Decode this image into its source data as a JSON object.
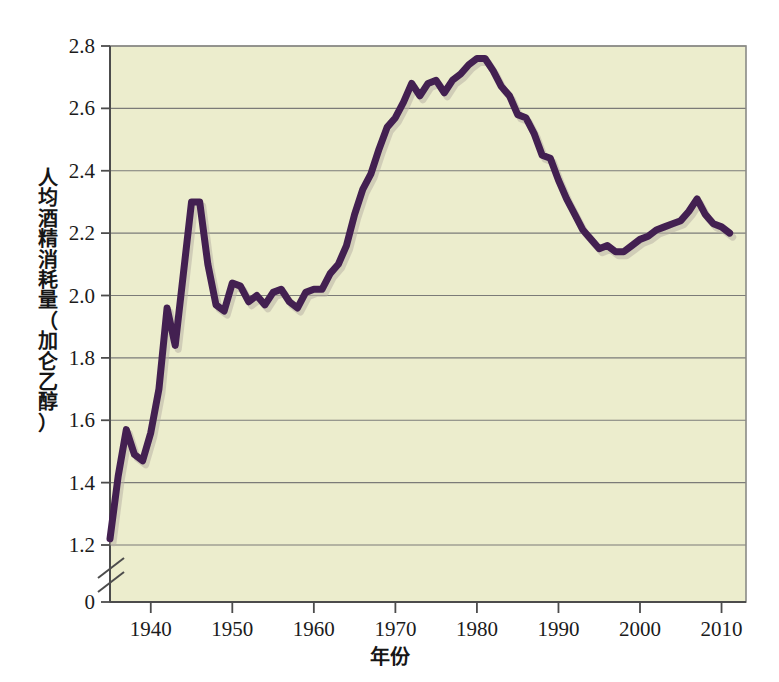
{
  "chart_data": {
    "type": "line",
    "title": "",
    "xlabel": "年份",
    "ylabel": "人均酒精消耗量（加仑乙醇）",
    "xlim": [
      1935,
      2013
    ],
    "ylim": [
      1.15,
      2.8
    ],
    "axis_break": true,
    "axis_break_note": "y-axis broken between 0 and 1.2",
    "grid": true,
    "legend": "none",
    "y_ticks": [
      "0",
      "1.2",
      "1.4",
      "1.6",
      "1.8",
      "2.0",
      "2.2",
      "2.4",
      "2.6",
      "2.8"
    ],
    "y_tick_values": [
      0,
      1.2,
      1.4,
      1.6,
      1.8,
      2.0,
      2.2,
      2.4,
      2.6,
      2.8
    ],
    "x_ticks": [
      "1940",
      "1950",
      "1960",
      "1970",
      "1980",
      "1990",
      "2000",
      "2010"
    ],
    "x_tick_values": [
      1940,
      1950,
      1960,
      1970,
      1980,
      1990,
      2000,
      2010
    ],
    "series": [
      {
        "name": "人均酒精消耗量",
        "color": "#432051",
        "x": [
          1935,
          1936,
          1937,
          1938,
          1939,
          1940,
          1941,
          1942,
          1943,
          1944,
          1945,
          1946,
          1947,
          1948,
          1949,
          1950,
          1951,
          1952,
          1953,
          1954,
          1955,
          1956,
          1957,
          1958,
          1959,
          1960,
          1961,
          1962,
          1963,
          1964,
          1965,
          1966,
          1967,
          1968,
          1969,
          1970,
          1971,
          1972,
          1973,
          1974,
          1975,
          1976,
          1977,
          1978,
          1979,
          1980,
          1981,
          1982,
          1983,
          1984,
          1985,
          1986,
          1987,
          1988,
          1989,
          1990,
          1991,
          1992,
          1993,
          1994,
          1995,
          1996,
          1997,
          1998,
          1999,
          2000,
          2001,
          2002,
          2003,
          2004,
          2005,
          2006,
          2007,
          2008,
          2009,
          2010,
          2011
        ],
        "y": [
          1.22,
          1.42,
          1.57,
          1.49,
          1.47,
          1.56,
          1.7,
          1.96,
          1.84,
          2.07,
          2.3,
          2.3,
          2.1,
          1.97,
          1.95,
          2.04,
          2.03,
          1.98,
          2.0,
          1.97,
          2.01,
          2.02,
          1.98,
          1.96,
          2.01,
          2.02,
          2.02,
          2.07,
          2.1,
          2.16,
          2.26,
          2.34,
          2.39,
          2.47,
          2.54,
          2.57,
          2.62,
          2.68,
          2.64,
          2.68,
          2.69,
          2.65,
          2.69,
          2.71,
          2.74,
          2.76,
          2.76,
          2.72,
          2.67,
          2.64,
          2.58,
          2.57,
          2.52,
          2.45,
          2.44,
          2.37,
          2.31,
          2.26,
          2.21,
          2.18,
          2.15,
          2.16,
          2.14,
          2.14,
          2.16,
          2.18,
          2.19,
          2.21,
          2.22,
          2.23,
          2.24,
          2.27,
          2.31,
          2.26,
          2.23,
          2.22,
          2.2
        ]
      }
    ]
  },
  "axes": {
    "x_title": "年份",
    "y_title_vertical": "人\n均\n酒\n精\n消\n耗\n量\n（\n加\n仑\n乙\n醇\n）"
  },
  "style": {
    "plot_background": "#ecedcd",
    "line_color": "#432051",
    "grid_color": "#7b7b78",
    "frame_color": "#8a8a86",
    "text_color": "#1b1b1b",
    "page_background": "#ffffff"
  }
}
